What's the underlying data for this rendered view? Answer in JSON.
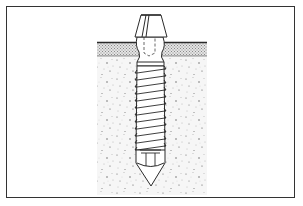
{
  "figure": {
    "parts": [
      "abutment-head",
      "soft-tissue-layer",
      "bone",
      "threaded-body",
      "apical-tip"
    ],
    "thread_count": 12,
    "colors": {
      "line": "#2a2a2a",
      "bone_speckle": "#6a6a6a",
      "tissue_hatch": "#9a9a9a",
      "background": "#ffffff",
      "frame": "#333333"
    }
  }
}
